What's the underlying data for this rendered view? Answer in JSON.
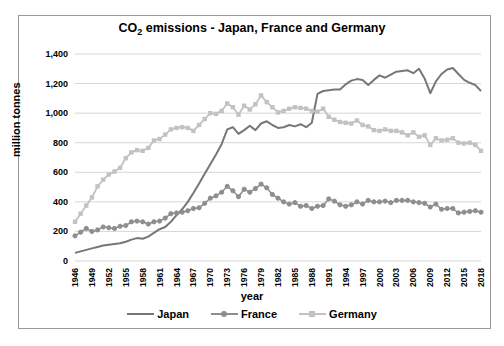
{
  "figure": {
    "title_prefix": "CO",
    "title_sub": "2",
    "title_rest": " emissions - Japan, France and Germany"
  },
  "chart_data": {
    "type": "line",
    "title": "CO2 emissions - Japan, France and Germany",
    "xlabel": "year",
    "ylabel": "million tonnes",
    "ylim": [
      0,
      1400
    ],
    "ytick_step": 200,
    "ytick_labels": [
      "0",
      "200",
      "400",
      "600",
      "800",
      "1,000",
      "1,200",
      "1,400"
    ],
    "xtick_labels": [
      1946,
      1949,
      1952,
      1955,
      1958,
      1961,
      1964,
      1967,
      1970,
      1973,
      1976,
      1979,
      1982,
      1985,
      1988,
      1991,
      1994,
      1997,
      2000,
      2003,
      2006,
      2009,
      2012,
      2015,
      2018
    ],
    "grid": true,
    "legend_position": "bottom",
    "x": [
      1946,
      1947,
      1948,
      1949,
      1950,
      1951,
      1952,
      1953,
      1954,
      1955,
      1956,
      1957,
      1958,
      1959,
      1960,
      1961,
      1962,
      1963,
      1964,
      1965,
      1966,
      1967,
      1968,
      1969,
      1970,
      1971,
      1972,
      1973,
      1974,
      1975,
      1976,
      1977,
      1978,
      1979,
      1980,
      1981,
      1982,
      1983,
      1984,
      1985,
      1986,
      1987,
      1988,
      1989,
      1990,
      1991,
      1992,
      1993,
      1994,
      1995,
      1996,
      1997,
      1998,
      1999,
      2000,
      2001,
      2002,
      2003,
      2004,
      2005,
      2006,
      2007,
      2008,
      2009,
      2010,
      2011,
      2012,
      2013,
      2014,
      2015,
      2016,
      2017,
      2018
    ],
    "series": [
      {
        "name": "Japan",
        "color": "#777777",
        "marker": "none",
        "line_width": 2,
        "values": [
          55,
          65,
          75,
          85,
          95,
          105,
          110,
          115,
          120,
          130,
          145,
          155,
          150,
          165,
          190,
          215,
          230,
          265,
          310,
          350,
          400,
          460,
          525,
          590,
          655,
          720,
          790,
          890,
          905,
          860,
          885,
          915,
          885,
          930,
          945,
          920,
          900,
          905,
          920,
          910,
          925,
          905,
          935,
          1130,
          1150,
          1155,
          1160,
          1160,
          1195,
          1220,
          1230,
          1225,
          1190,
          1225,
          1255,
          1240,
          1260,
          1280,
          1285,
          1290,
          1270,
          1300,
          1235,
          1135,
          1215,
          1265,
          1295,
          1305,
          1265,
          1225,
          1205,
          1190,
          1150
        ]
      },
      {
        "name": "France",
        "color": "#8e8e8e",
        "marker": "circle",
        "line_width": 1.5,
        "values": [
          170,
          195,
          220,
          200,
          210,
          230,
          225,
          220,
          235,
          240,
          265,
          270,
          265,
          250,
          265,
          270,
          290,
          320,
          325,
          330,
          340,
          355,
          360,
          390,
          425,
          440,
          465,
          505,
          475,
          435,
          485,
          465,
          490,
          520,
          495,
          450,
          425,
          400,
          385,
          395,
          370,
          375,
          355,
          370,
          375,
          420,
          405,
          380,
          370,
          380,
          400,
          385,
          410,
          400,
          400,
          405,
          395,
          410,
          410,
          410,
          400,
          395,
          390,
          365,
          385,
          350,
          355,
          355,
          325,
          330,
          335,
          340,
          330
        ]
      },
      {
        "name": "Germany",
        "color": "#c2c2c2",
        "marker": "square",
        "line_width": 1.8,
        "values": [
          265,
          320,
          375,
          430,
          505,
          550,
          585,
          605,
          630,
          695,
          735,
          750,
          745,
          765,
          815,
          825,
          855,
          890,
          900,
          905,
          900,
          880,
          920,
          960,
          1000,
          995,
          1015,
          1065,
          1040,
          990,
          1050,
          1025,
          1060,
          1120,
          1075,
          1040,
          1005,
          1015,
          1030,
          1040,
          1035,
          1030,
          1015,
          1010,
          1030,
          975,
          955,
          940,
          935,
          930,
          950,
          920,
          910,
          885,
          880,
          890,
          880,
          880,
          870,
          850,
          870,
          840,
          850,
          785,
          830,
          815,
          820,
          830,
          800,
          795,
          800,
          785,
          745
        ]
      }
    ],
    "style": {
      "grid_color": "#d6d6d6",
      "frame_color": "#9b9b9b",
      "background": "#ffffff"
    }
  }
}
